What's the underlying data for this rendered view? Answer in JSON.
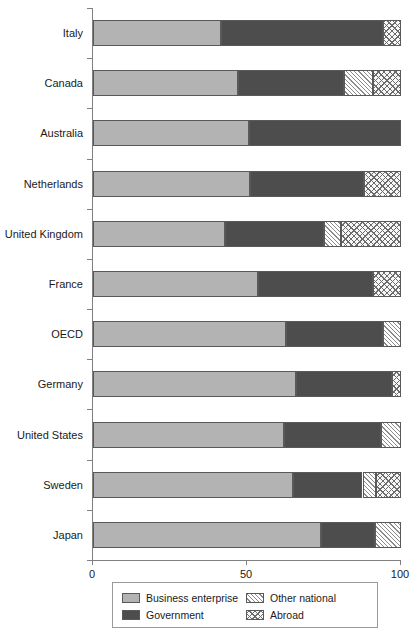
{
  "chart_data": {
    "type": "bar",
    "orientation": "horizontal",
    "stacked": true,
    "title": "",
    "xlabel": "",
    "ylabel": "",
    "xlim": [
      0,
      100
    ],
    "xticks": [
      0,
      50,
      100
    ],
    "xtick_labels": [
      "0",
      "50",
      "100"
    ],
    "grid": false,
    "legend_position": "bottom",
    "categories": [
      "Italy",
      "Canada",
      "Australia",
      "Netherlands",
      "United Kingdom",
      "France",
      "OECD",
      "Germany",
      "United States",
      "Sweden",
      "Japan"
    ],
    "series": [
      {
        "name": "Business enterprise",
        "color": "#b3b3b3",
        "pattern": "solid-light-gray",
        "values": [
          41.5,
          47.0,
          50.5,
          51.0,
          43.0,
          53.5,
          62.5,
          66.0,
          62.0,
          65.0,
          74.0
        ]
      },
      {
        "name": "Government",
        "color": "#4d4d4d",
        "pattern": "solid-dark-gray",
        "values": [
          52.5,
          34.5,
          49.5,
          37.0,
          32.0,
          37.5,
          31.5,
          31.0,
          31.5,
          22.5,
          17.5
        ]
      },
      {
        "name": "Other national",
        "color": "#f7f7f7",
        "pattern": "diagonal-hatch",
        "values": [
          0.0,
          9.5,
          0.0,
          0.0,
          5.5,
          0.0,
          6.0,
          0.0,
          6.5,
          4.5,
          8.5
        ]
      },
      {
        "name": "Abroad",
        "color": "#f7f7f7",
        "pattern": "cross-hatch",
        "values": [
          6.0,
          9.0,
          0.0,
          12.0,
          19.5,
          9.0,
          0.0,
          3.0,
          0.0,
          8.0,
          0.0
        ]
      }
    ]
  },
  "legend": {
    "items": [
      {
        "label": "Business enterprise",
        "swatch": "business"
      },
      {
        "label": "Other national",
        "swatch": "other"
      },
      {
        "label": "Government",
        "swatch": "government"
      },
      {
        "label": "Abroad",
        "swatch": "abroad"
      }
    ]
  }
}
